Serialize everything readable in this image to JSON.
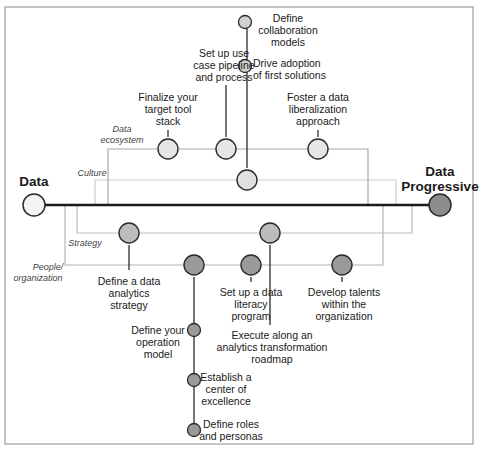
{
  "endpoints": {
    "start": {
      "label_line1": "Data",
      "label_line2": "Active",
      "color": "#f4f4f4"
    },
    "end": {
      "label_line1": "Data",
      "label_line2": "Progressive",
      "color": "#8c8c8c"
    }
  },
  "tracks": {
    "data_ecosystem": {
      "label_line1": "Data",
      "label_line2": "ecosystem",
      "color": "#a8a8a8"
    },
    "culture": {
      "label": "Culture",
      "color": "#cccccc"
    },
    "strategy": {
      "label": "Strategy",
      "color": "#bdbdbd"
    },
    "people": {
      "label_line1": "People/",
      "label_line2": "organization",
      "color": "#b3b3b3"
    }
  },
  "milestones": {
    "tool_stack": {
      "lines": [
        "Finalize your",
        "target tool",
        "stack"
      ]
    },
    "use_case": {
      "lines": [
        "Set up use",
        "case pipeline",
        "and process"
      ]
    },
    "liberalization": {
      "lines": [
        "Foster a data",
        "liberalization",
        "approach"
      ]
    },
    "collaboration": {
      "lines": [
        "Define",
        "collaboration",
        "models"
      ]
    },
    "adoption": {
      "lines": [
        "Drive adoption",
        "of first solutions"
      ]
    },
    "analytics_strategy": {
      "lines": [
        "Define a data",
        "analytics",
        "strategy"
      ]
    },
    "roadmap": {
      "lines": [
        "Execute along an",
        "analytics transformation",
        "roadmap"
      ]
    },
    "literacy": {
      "lines": [
        "Set up a data",
        "literacy",
        "program"
      ]
    },
    "talents": {
      "lines": [
        "Develop talents",
        "within the",
        "organization"
      ]
    },
    "operation_model": {
      "lines": [
        "Define your",
        "operation",
        "model"
      ]
    },
    "coe": {
      "lines": [
        "Establish a",
        "center of",
        "excellence"
      ]
    },
    "roles": {
      "lines": [
        "Define roles",
        "and personas"
      ]
    }
  },
  "colors": {
    "ecosystem_node": "#e6e6e6",
    "culture_node": "#e0e0e0",
    "strategy_node": "#bcbcbc",
    "people_node": "#9a9a9a",
    "stroke": "#2b2b2b",
    "frame": "#9e9e9e"
  }
}
